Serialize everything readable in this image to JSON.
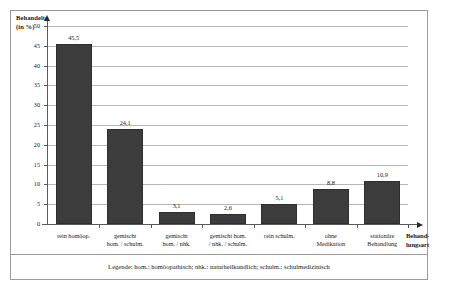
{
  "chart_data": {
    "type": "bar",
    "title": "",
    "ylabel": "Behandelte\n(in %)",
    "xlabel": "Behand-\nlungsart",
    "ylim": [
      0,
      50
    ],
    "yticks": [
      0,
      5,
      10,
      15,
      20,
      25,
      30,
      35,
      40,
      45,
      50
    ],
    "ytick_labels": [
      "0",
      "5",
      "10",
      "15",
      "20",
      "25",
      "30",
      "35",
      "40",
      "45",
      "50"
    ],
    "grid": true,
    "legend_position": "below-plot",
    "categories": [
      "rein homöop.",
      "gemischt\nhom. / schulm.",
      "gemischt\nhom. / nhk.",
      "gemischt hom.\n/ nhk. / schulm.",
      "rein schulm.",
      "ohne\nMedikation",
      "stationäre\nBehandlung"
    ],
    "values": [
      45.5,
      24.1,
      3.1,
      2.6,
      5.1,
      8.8,
      10.9
    ],
    "value_labels": [
      "45,5",
      "24,1",
      "3,1",
      "2,6",
      "5,1",
      "8,8",
      "10,9"
    ],
    "bar_color": "#3c3c3c",
    "grid_color": "#b6b6b6",
    "axis_color": "#5a5a5a"
  },
  "legend": {
    "text": "Legende: hom.: homöopathisch; nhk.: naturheilkundlich; schulm.: schulmedizinisch"
  }
}
